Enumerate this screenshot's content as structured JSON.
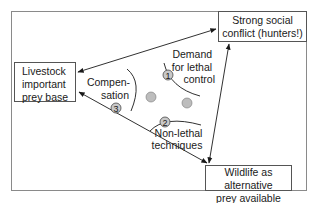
{
  "diagram": {
    "nodes": {
      "livestock": {
        "lines": [
          "Livestock",
          "important",
          "prey base"
        ]
      },
      "conflict": {
        "lines": [
          "Strong social",
          "conflict (hunters!)"
        ]
      },
      "wildlife": {
        "lines": [
          "Wildlife as alternative",
          "prey available"
        ]
      }
    },
    "strategies": {
      "demand": {
        "number": "1",
        "lines": [
          "Demand",
          "for lethal",
          "control"
        ]
      },
      "nonlethal": {
        "number": "2",
        "lines": [
          "Non-lethal",
          "techniques"
        ]
      },
      "compensation": {
        "number": "3",
        "lines": [
          "Compen-",
          "sation"
        ]
      }
    },
    "edges": [
      {
        "from": "conflict",
        "to": "livestock",
        "arrows": "both"
      },
      {
        "from": "conflict",
        "to": "wildlife",
        "arrows": "both"
      },
      {
        "from": "wildlife",
        "to": "livestock",
        "arrows": "both"
      }
    ],
    "colors": {
      "circle_fill": "#bdbdbd",
      "line": "#1a1a1a",
      "frame": "#8a8a8a"
    }
  }
}
